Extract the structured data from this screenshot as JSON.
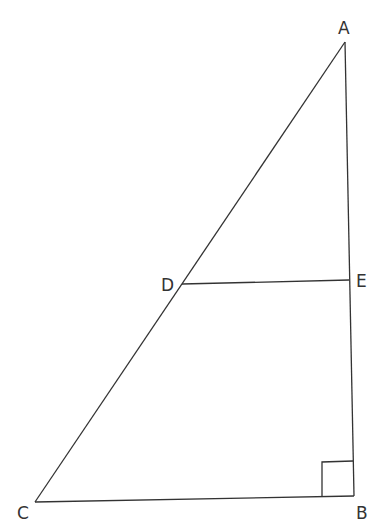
{
  "diagram": {
    "type": "right triangle with parallel segment",
    "stroke_color": "#333333",
    "background": "#ffffff",
    "points": {
      "A": {
        "label": "A",
        "x": 345,
        "y": 42
      },
      "B": {
        "label": "B",
        "x": 354,
        "y": 496
      },
      "C": {
        "label": "C",
        "x": 35,
        "y": 502
      },
      "D": {
        "label": "D",
        "x": 182,
        "y": 284
      },
      "E": {
        "label": "E",
        "x": 349,
        "y": 280
      }
    },
    "segments": [
      "AB",
      "BC",
      "CA",
      "DE"
    ],
    "right_angle_at": "B"
  }
}
